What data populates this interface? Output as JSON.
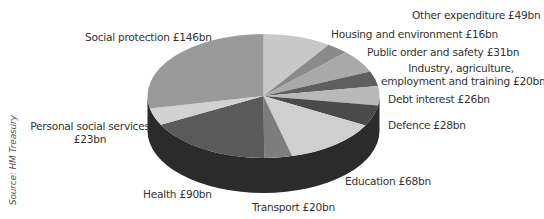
{
  "chart_data": {
    "type": "pie",
    "style": "3d-exploded-none",
    "title": "",
    "unit": "£bn",
    "total": 517,
    "start_angle": "12 o'clock",
    "direction": "clockwise",
    "slices": [
      {
        "label": "Other expenditure",
        "value": 49,
        "display": "Other expenditure £49bn",
        "color": "#c8c8c8"
      },
      {
        "label": "Housing and environment",
        "value": 16,
        "display": "Housing and environment £16bn",
        "color": "#8a8a8a"
      },
      {
        "label": "Public order and safety",
        "value": 31,
        "display": "Public order and safety £31bn",
        "color": "#a9a9a9"
      },
      {
        "label": "Industry, agriculture, employment and training",
        "value": 20,
        "display": "Industry, agriculture, employment and training £20bn",
        "color": "#5f5f5f"
      },
      {
        "label": "Debt interest",
        "value": 26,
        "display": "Debt interest £26bn",
        "color": "#b9b9b9"
      },
      {
        "label": "Defence",
        "value": 28,
        "display": "Defence £28bn",
        "color": "#4a4a4a"
      },
      {
        "label": "Education",
        "value": 68,
        "display": "Education £68bn",
        "color": "#cfcfcf"
      },
      {
        "label": "Transport",
        "value": 20,
        "display": "Transport £20bn",
        "color": "#7d7d7d"
      },
      {
        "label": "Health",
        "value": 90,
        "display": "Health £90bn",
        "color": "#5a5a5a"
      },
      {
        "label": "Personal social services",
        "value": 23,
        "display": "Personal social services £23bn",
        "color": "#d2d2d2"
      },
      {
        "label": "Social protection",
        "value": 146,
        "display": "Social protection £146bn",
        "color": "#9a9a9a"
      }
    ],
    "side_color": "#2b2b2b",
    "source": "Source: HM Treasury"
  },
  "labels": {
    "other": "Other expenditure £49bn",
    "housing": "Housing and environment £16bn",
    "public_order": "Public order and safety £31bn",
    "industry_line1": "Industry, agriculture,",
    "industry_line2": "employment and training £20bn",
    "debt": "Debt interest £26bn",
    "defence": "Defence £28bn",
    "education": "Education £68bn",
    "transport": "Transport £20bn",
    "health": "Health £90bn",
    "pss_line1": "Personal social services",
    "pss_line2": "£23bn",
    "social": "Social protection £146bn"
  },
  "source": "Source: HM Treasury"
}
